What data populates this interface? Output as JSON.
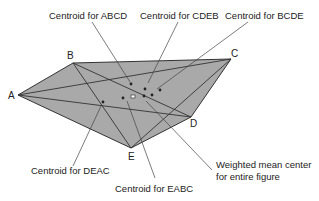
{
  "figure": {
    "vertices": [
      {
        "id": "A",
        "label": "A"
      },
      {
        "id": "B",
        "label": "B"
      },
      {
        "id": "C",
        "label": "C"
      },
      {
        "id": "D",
        "label": "D"
      },
      {
        "id": "E",
        "label": "E"
      }
    ],
    "annotations": {
      "abcd": "Centroid for ABCD",
      "cdeb": "Centroid for CDEB",
      "bcde": "Centroid for BCDE",
      "deac": "Centroid for DEAC",
      "eabc": "Centroid for EABC",
      "weighted_line1": "Weighted mean center",
      "weighted_line2": "for entire figure"
    },
    "colors": {
      "fill": "#a9a9a9",
      "stroke": "#333333",
      "text": "#222222"
    }
  }
}
